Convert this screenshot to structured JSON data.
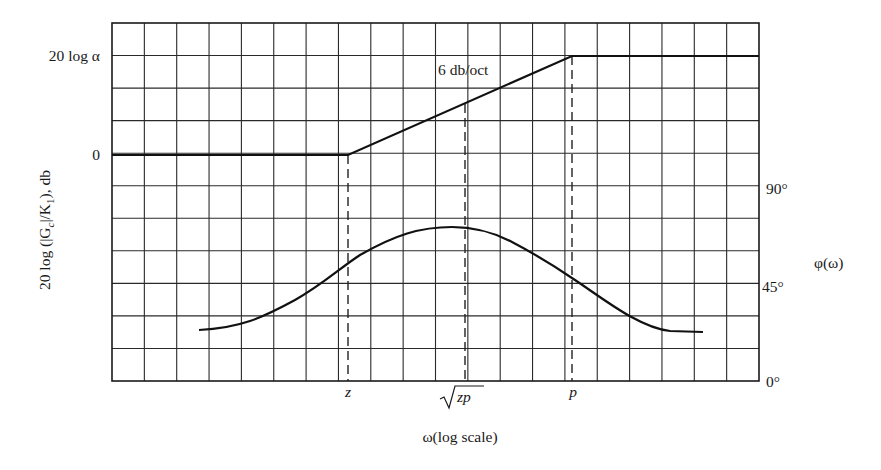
{
  "chart_data": {
    "type": "line",
    "title": "",
    "xlabel": "ω(log scale)",
    "ylabel_left": "20 log (|G_c|/K_1), db",
    "ylabel_right": "φ(ω)",
    "grid": true,
    "grid_columns": 20,
    "grid_rows": 11,
    "x_tick_labels": [
      "z",
      "√zp",
      "p"
    ],
    "left_tick_labels": [
      "20 log α",
      "0"
    ],
    "right_tick_labels": [
      "90°",
      "45°",
      "0°"
    ],
    "annotations": [
      "6 db/oct"
    ],
    "series": [
      {
        "name": "magnitude (asymptotic)",
        "axis": "left",
        "x": [
          "start",
          "z",
          "√zp",
          "p",
          "end"
        ],
        "values_db": [
          "0",
          "0",
          "10 log α",
          "20 log α",
          "20 log α"
        ],
        "slope_between_z_and_p": "6 db/oct"
      },
      {
        "name": "phase φ(ω)",
        "axis": "right",
        "x": [
          "far left",
          "z",
          "√zp (max)",
          "p",
          "far right"
        ],
        "values_deg": [
          15,
          54,
          72,
          51,
          14
        ],
        "peak_at": "√zp"
      }
    ]
  },
  "labels": {
    "left_top": "20 log α",
    "left_zero": "0",
    "ylabel_left_main": "20 log (|G",
    "ylabel_left_sub_c": "c",
    "ylabel_left_mid": "|/K",
    "ylabel_left_sub_1": "1",
    "ylabel_left_end": "), db",
    "slope": "6 db/oct",
    "right_90": "90°",
    "right_45": "45°",
    "right_0": "0°",
    "phase_axis": "φ(ω)",
    "x_z": "z",
    "x_sqrt_zp": "zp",
    "x_p": "p",
    "xlabel": "ω(log scale)"
  }
}
